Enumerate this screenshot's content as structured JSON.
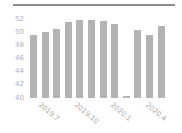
{
  "chart_data": {
    "type": "bar",
    "title": "",
    "xlabel": "",
    "ylabel": "",
    "ylim": [
      40,
      52
    ],
    "yticks": [
      40,
      42,
      44,
      46,
      48,
      50,
      52
    ],
    "categories": [
      "2019.6",
      "2019.7",
      "2019.8",
      "2019.9",
      "2019.10",
      "2019.11",
      "2019.12",
      "2020.1",
      "2020.2",
      "2020.3",
      "2020.4",
      "2020.5"
    ],
    "visible_xtick_labels": [
      "2019.7",
      "2019.10",
      "2020.1",
      "2020.4"
    ],
    "values": [
      49.6,
      50.1,
      50.5,
      51.6,
      51.9,
      51.9,
      51.7,
      51.3,
      40.3,
      50.3,
      49.6,
      51.0
    ],
    "grid": false,
    "legend": null,
    "bar_color": "#b3b3b3"
  },
  "labels": {
    "yticks": [
      "52",
      "50",
      "48",
      "46",
      "44",
      "42",
      "40"
    ],
    "x": [
      "2019.7",
      "2019.10",
      "2020.1",
      "2020.4"
    ]
  }
}
